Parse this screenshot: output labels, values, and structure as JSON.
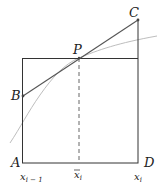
{
  "diagram": {
    "points": {
      "A": "A",
      "B": "B",
      "C": "C",
      "D": "D",
      "P": "P"
    },
    "axis_labels": {
      "left": {
        "base": "x",
        "sub": "i − 1"
      },
      "mid": {
        "base": "x",
        "sub": "i",
        "bar": true
      },
      "right": {
        "base": "x",
        "sub": "i"
      }
    },
    "colors": {
      "rectangle": "#333333",
      "tangent_line": "#555555",
      "curve": "#b0b0b0",
      "dashed": "#555555"
    }
  }
}
